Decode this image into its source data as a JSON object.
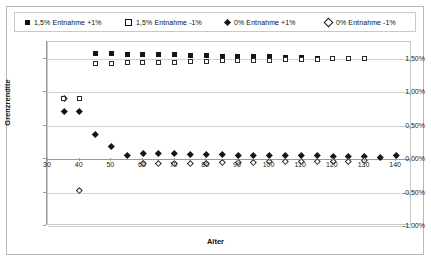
{
  "chart_data": {
    "type": "scatter",
    "title": "",
    "xlabel": "Alter",
    "ylabel": "Grenzrendite",
    "xlim": [
      30,
      145
    ],
    "ylim": [
      -1.0,
      1.75
    ],
    "grid": true,
    "legend_position": "top",
    "x_ticks": [
      30,
      40,
      50,
      60,
      70,
      80,
      90,
      100,
      110,
      120,
      130,
      140
    ],
    "x_tick_labels": [
      "30",
      "40",
      "50",
      "60",
      "70",
      "80",
      "90",
      "100",
      "110",
      "120",
      "130",
      "140"
    ],
    "y_ticks": [
      1.5,
      1.0,
      0.5,
      0.0,
      -0.5,
      -1.0
    ],
    "y_tick_labels": [
      "1,50%",
      "1,00%",
      "0,50%",
      "0,00%",
      "-0,50%",
      "-1,00%"
    ],
    "series": [
      {
        "name": "1,5% Entnahme +1%",
        "marker": "sq-filled",
        "x": [
          45,
          50,
          55,
          60,
          65,
          70,
          75,
          80,
          85,
          90,
          95,
          100,
          105,
          110,
          115,
          120,
          125,
          130
        ],
        "y": [
          1.58,
          1.58,
          1.57,
          1.57,
          1.56,
          1.56,
          1.55,
          1.55,
          1.54,
          1.54,
          1.53,
          1.53,
          1.52,
          1.52,
          1.51,
          1.51,
          1.5,
          1.5
        ]
      },
      {
        "name": "1,5% Entnahme -1%",
        "marker": "sq-hollow",
        "x": [
          45,
          50,
          55,
          60,
          65,
          70,
          75,
          80,
          85,
          90,
          95,
          100,
          105,
          110,
          115,
          120,
          125,
          130
        ],
        "y": [
          1.43,
          1.43,
          1.44,
          1.44,
          1.45,
          1.45,
          1.46,
          1.46,
          1.47,
          1.47,
          1.48,
          1.48,
          1.49,
          1.49,
          1.49,
          1.5,
          1.5,
          1.5
        ]
      },
      {
        "name": "0% Entnahme +1%",
        "marker": "di-filled",
        "x": [
          35,
          40,
          45,
          50,
          55,
          60,
          65,
          70,
          75,
          80,
          85,
          90,
          95,
          100,
          105,
          110,
          115,
          120,
          125,
          130,
          135,
          140
        ],
        "y": [
          0.72,
          0.72,
          0.37,
          0.19,
          0.06,
          0.08,
          0.08,
          0.08,
          0.07,
          0.07,
          0.07,
          0.06,
          0.06,
          0.06,
          0.05,
          0.05,
          0.05,
          0.04,
          0.04,
          0.04,
          0.03,
          0.06
        ]
      },
      {
        "name": "0% Entnahme -1%",
        "marker": "di-hollow",
        "x": [
          35,
          40,
          60,
          65,
          70,
          75,
          80,
          85,
          90,
          95,
          100,
          105,
          110,
          115,
          120,
          125,
          130
        ],
        "y": [
          0.91,
          -0.47,
          -0.07,
          -0.07,
          -0.06,
          -0.06,
          -0.06,
          -0.05,
          -0.05,
          -0.05,
          -0.04,
          -0.04,
          -0.04,
          -0.03,
          -0.03,
          -0.03,
          -0.02
        ]
      },
      {
        "name": "1,5% Entnahme -1% low",
        "marker": "sq-hollow",
        "x": [
          35,
          40
        ],
        "y": [
          0.91,
          0.91
        ]
      }
    ],
    "legend": [
      {
        "label": "1,5% Entnahme +1%",
        "marker": "sq-filled"
      },
      {
        "label": "1,5% Entnahme -1%",
        "marker": "sq-hollow"
      },
      {
        "label": "0% Entnahme +1%",
        "marker": "di-filled"
      },
      {
        "label": "0% Entnahme -1%",
        "marker": "di-hollow"
      }
    ]
  }
}
